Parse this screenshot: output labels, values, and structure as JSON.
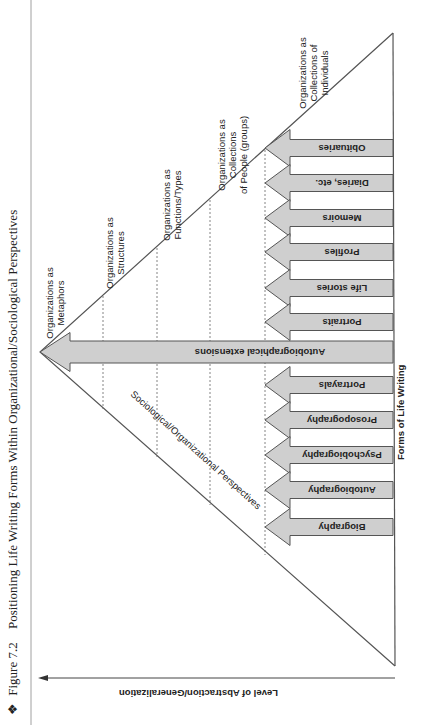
{
  "figure": {
    "bullet": "❖",
    "number": "Figure 7.2",
    "title": "Positioning Life Writing Forms Within Organizational/Sociological Perspectives"
  },
  "axes": {
    "y_label": "Level of Abstraction/Generalization",
    "x_label": "Forms of Life Writing",
    "diagonal_label": "Sociological/Organizational Perspectives"
  },
  "levels": [
    {
      "id": "metaphors",
      "lines": [
        "Organizations as",
        "Metaphors"
      ]
    },
    {
      "id": "structures",
      "lines": [
        "Organizations as",
        "Structures"
      ]
    },
    {
      "id": "functions",
      "lines": [
        "Organizations as",
        "Functions/Types"
      ]
    },
    {
      "id": "groups",
      "lines": [
        "Organizations as",
        "Collections",
        "of People (groups)"
      ]
    },
    {
      "id": "individuals",
      "lines": [
        "Organizations as",
        "Collections of",
        "Individuals"
      ]
    }
  ],
  "forms": [
    {
      "label": "Obituaries"
    },
    {
      "label": "Diaries, etc."
    },
    {
      "label": "Memoirs"
    },
    {
      "label": "Profiles"
    },
    {
      "label": "Life stories"
    },
    {
      "label": "Portraits"
    },
    {
      "label": "Autobiographical extensions",
      "long": true
    },
    {
      "label": "Portrayals"
    },
    {
      "label": "Prosopography"
    },
    {
      "label": "Psychobiography"
    },
    {
      "label": "Autobiography"
    },
    {
      "label": "Biography"
    }
  ],
  "colors": {
    "arrow_fill": "#cfcfcf",
    "line": "#555555",
    "text": "#222222"
  }
}
